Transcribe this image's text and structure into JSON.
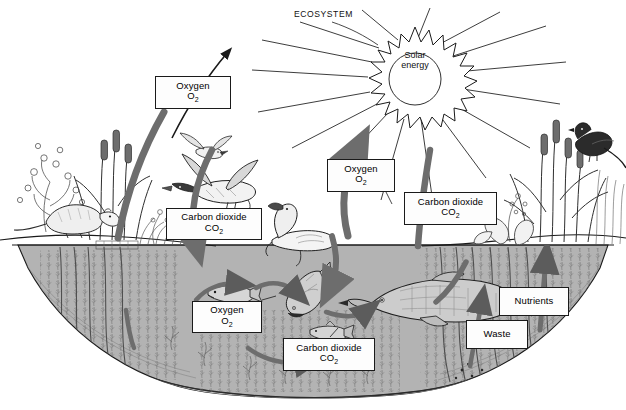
{
  "diagram": {
    "title": "ECOSYSTEM",
    "type": "pond-ecosystem-cycle",
    "sun": {
      "line1": "Solar",
      "line2": "energy",
      "name": "solar-energy"
    },
    "colors": {
      "water": "#b3b3b3",
      "sediment": "#c9c9c9",
      "arrow_thick": "#6d6d6d",
      "arrow_thin": "#8a8a8a",
      "ink": "#1a1a1a",
      "sky": "#ffffff",
      "label_fill": "#fdfdfd"
    },
    "labels": [
      {
        "id": "oxygen-air-left",
        "name": "label-oxygen-air-left",
        "line1": "Oxygen",
        "sub": "O",
        "subnum": "2",
        "x": 155,
        "y": 76,
        "w": 76,
        "h": 33
      },
      {
        "id": "co2-air-left",
        "name": "label-carbon-dioxide-air-left",
        "line1": "Carbon dioxide",
        "sub": "CO",
        "subnum": "2",
        "x": 166,
        "y": 208,
        "w": 96,
        "h": 32
      },
      {
        "id": "oxygen-center",
        "name": "label-oxygen-center",
        "line1": "Oxygen",
        "sub": "O",
        "subnum": "2",
        "x": 327,
        "y": 159,
        "w": 68,
        "h": 33
      },
      {
        "id": "co2-center",
        "name": "label-carbon-dioxide-center",
        "line1": "Carbon dioxide",
        "sub": "CO",
        "subnum": "2",
        "x": 404,
        "y": 192,
        "w": 93,
        "h": 33
      },
      {
        "id": "oxygen-water",
        "name": "label-oxygen-underwater",
        "line1": "Oxygen",
        "sub": "O",
        "subnum": "2",
        "x": 192,
        "y": 301,
        "w": 70,
        "h": 32
      },
      {
        "id": "co2-water",
        "name": "label-carbon-dioxide-underwater",
        "line1": "Carbon dioxide",
        "sub": "CO",
        "subnum": "2",
        "x": 283,
        "y": 338,
        "w": 92,
        "h": 33
      },
      {
        "id": "nutrients",
        "name": "label-nutrients",
        "line1": "Nutrients",
        "sub": "",
        "subnum": "",
        "x": 499,
        "y": 287,
        "w": 70,
        "h": 29
      },
      {
        "id": "waste",
        "name": "label-waste",
        "line1": "Waste",
        "sub": "",
        "subnum": "",
        "x": 466,
        "y": 320,
        "w": 62,
        "h": 29
      }
    ],
    "organisms": [
      {
        "name": "muskrat",
        "zone": "left-shore"
      },
      {
        "name": "cattail-plants-left",
        "zone": "left-shore"
      },
      {
        "name": "flying-duck-small",
        "zone": "air"
      },
      {
        "name": "flying-duck-mallard",
        "zone": "air"
      },
      {
        "name": "swimming-duck",
        "zone": "water-surface"
      },
      {
        "name": "blackbird",
        "zone": "right-shore"
      },
      {
        "name": "cattail-plants-right",
        "zone": "right-shore"
      },
      {
        "name": "small-fish-left",
        "zone": "underwater"
      },
      {
        "name": "medium-fish",
        "zone": "underwater"
      },
      {
        "name": "minnow",
        "zone": "underwater"
      },
      {
        "name": "large-pike",
        "zone": "underwater"
      },
      {
        "name": "aquatic-weeds",
        "zone": "underwater"
      },
      {
        "name": "bottom-sediment",
        "zone": "pond-floor"
      }
    ],
    "flows": [
      {
        "from": "pond-plants",
        "to": "atmosphere",
        "substance": "Oxygen O2"
      },
      {
        "from": "atmosphere",
        "to": "pond",
        "substance": "Carbon dioxide CO2"
      },
      {
        "from": "solar-energy",
        "to": "pond",
        "substance": "light energy"
      },
      {
        "from": "fish",
        "to": "pond-water",
        "substance": "Carbon dioxide CO2"
      },
      {
        "from": "aquatic-plants",
        "to": "pond-water",
        "substance": "Oxygen O2"
      },
      {
        "from": "fish",
        "to": "sediment",
        "substance": "Waste"
      },
      {
        "from": "sediment",
        "to": "aquatic-plants",
        "substance": "Nutrients"
      }
    ]
  }
}
